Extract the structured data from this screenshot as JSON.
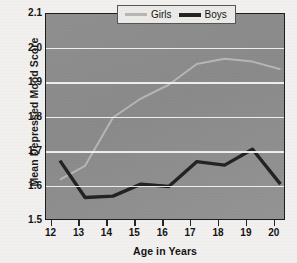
{
  "chart_data": {
    "type": "line",
    "title": "",
    "xlabel": "Age in Years",
    "ylabel": "Mean Depressed Mood Score",
    "xlim": [
      11.8,
      20.4
    ],
    "ylim": [
      1.5,
      2.1
    ],
    "xticks": [
      12,
      13,
      14,
      15,
      16,
      17,
      18,
      19,
      20
    ],
    "xtick_labels": [
      "12",
      "13",
      "14",
      "15",
      "16",
      "17",
      "18",
      "19",
      "20"
    ],
    "yticks": [
      1.5,
      1.6,
      1.7,
      1.8,
      1.9,
      2.0,
      2.1
    ],
    "ytick_labels": [
      "1.5",
      "1.6",
      "1.7",
      "1.8",
      "1.9",
      "2.0",
      "2.1"
    ],
    "gridlines_y": [
      1.6,
      1.7,
      1.8,
      1.9,
      2.0
    ],
    "grid": true,
    "legend_position": "top-right",
    "x": [
      12.3,
      13.2,
      14.2,
      15.2,
      16.2,
      17.2,
      18.2,
      19.2,
      20.2
    ],
    "series": [
      {
        "name": "Girls",
        "color": "#b6b6b6",
        "line_width": 2,
        "values": [
          1.62,
          1.66,
          1.8,
          1.855,
          1.895,
          1.955,
          1.97,
          1.962,
          1.94
        ]
      },
      {
        "name": "Boys",
        "color": "#232323",
        "line_width": 3.4,
        "values": [
          1.675,
          1.568,
          1.572,
          1.607,
          1.6,
          1.672,
          1.662,
          1.708,
          1.607
        ]
      }
    ]
  },
  "legend": {
    "entries": [
      {
        "label": "Girls",
        "swatch": "girls-line-swatch"
      },
      {
        "label": "Boys",
        "swatch": "boys-line-swatch"
      }
    ]
  },
  "colors": {
    "figure_background": "#f1f0ee",
    "plot_background": "#8e8e8e",
    "gridline": "#f4f3f1",
    "axis_border": "#1d1d1d",
    "girls_line": "#b6b6b6",
    "boys_line": "#232323",
    "legend_background": "#eceae7",
    "text": "#141414"
  }
}
